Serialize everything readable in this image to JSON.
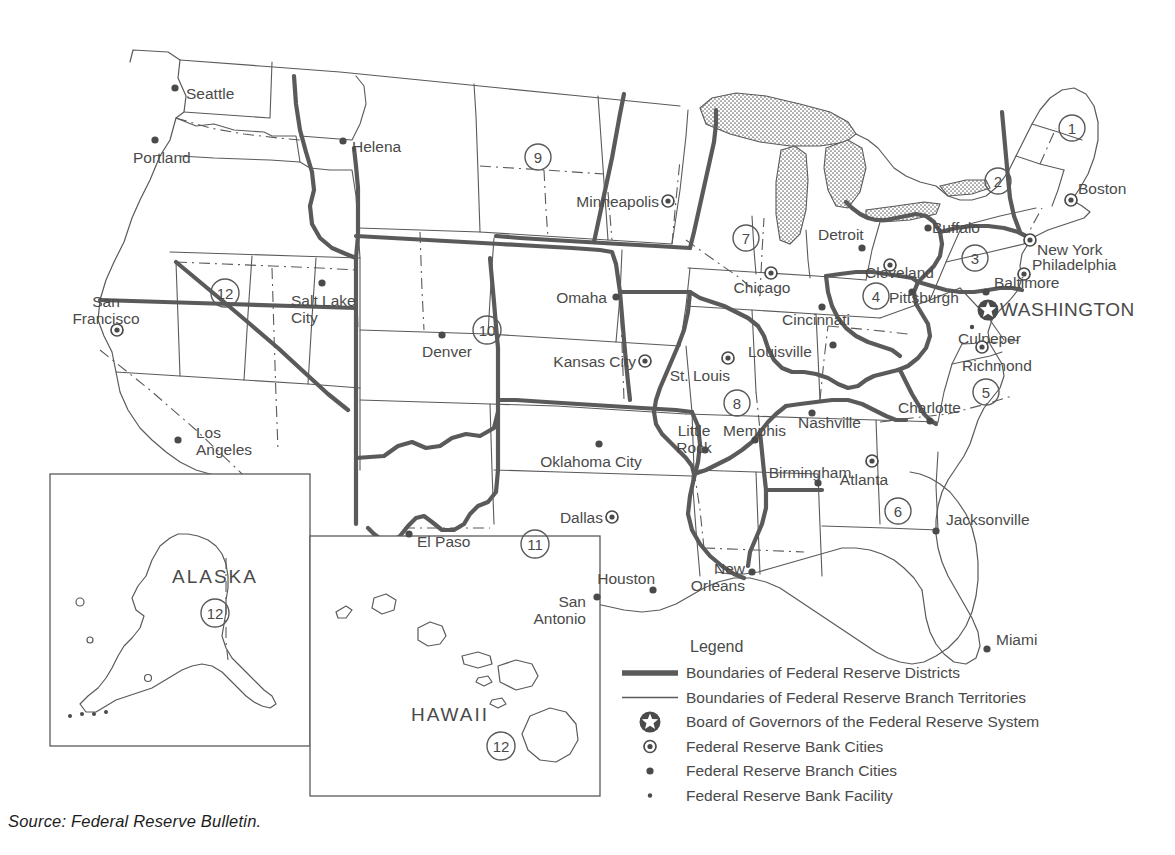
{
  "source_caption": "Source: Federal Reserve Bulletin.",
  "colors": {
    "line": "#5a5a5a",
    "text": "#4a4a4a",
    "background": "#ffffff",
    "marker": "#4a4a4a"
  },
  "legend": {
    "title": "Legend",
    "items": [
      {
        "symbol": "thick-line",
        "label": "Boundaries of Federal Reserve Districts"
      },
      {
        "symbol": "thin-line",
        "label": "Boundaries of Federal Reserve Branch Territories"
      },
      {
        "symbol": "star-in-circle",
        "label": "Board of Governors of the Federal Reserve System"
      },
      {
        "symbol": "dot-in-circle",
        "label": "Federal Reserve Bank Cities"
      },
      {
        "symbol": "filled-dot",
        "label": "Federal Reserve Branch Cities"
      },
      {
        "symbol": "small-dot",
        "label": "Federal Reserve Bank Facility"
      }
    ]
  },
  "insets": [
    {
      "name": "ALASKA",
      "district": "12",
      "label_x": 215,
      "label_y": 583,
      "num_x": 215,
      "num_y": 613
    },
    {
      "name": "HAWAII",
      "district": "12",
      "label_x": 450,
      "label_y": 721,
      "num_x": 501,
      "num_y": 746
    }
  ],
  "districts": [
    {
      "number": "1",
      "x": 1072,
      "y": 128
    },
    {
      "number": "2",
      "x": 998,
      "y": 181
    },
    {
      "number": "3",
      "x": 975,
      "y": 258
    },
    {
      "number": "4",
      "x": 876,
      "y": 296
    },
    {
      "number": "5",
      "x": 986,
      "y": 392
    },
    {
      "number": "6",
      "x": 898,
      "y": 511
    },
    {
      "number": "7",
      "x": 746,
      "y": 238
    },
    {
      "number": "8",
      "x": 737,
      "y": 403
    },
    {
      "number": "9",
      "x": 538,
      "y": 157
    },
    {
      "number": "10",
      "x": 487,
      "y": 330
    },
    {
      "number": "11",
      "x": 535,
      "y": 544
    },
    {
      "number": "12",
      "x": 225,
      "y": 293
    }
  ],
  "cities": [
    {
      "name": "Seattle",
      "type": "branch",
      "mx": 175,
      "my": 88,
      "tx": 186,
      "ty": 99,
      "anchor": "start"
    },
    {
      "name": "Portland",
      "type": "branch",
      "mx": 155,
      "my": 140,
      "tx": 133,
      "ty": 163,
      "anchor": "start"
    },
    {
      "name": "Helena",
      "type": "branch",
      "mx": 343,
      "my": 141,
      "tx": 352,
      "ty": 152,
      "anchor": "start"
    },
    {
      "name": "San\nFrancisco",
      "type": "bank",
      "mx": 117,
      "my": 330,
      "tx": 106,
      "ty": 307,
      "anchor": "middle"
    },
    {
      "name": "Los\nAngeles",
      "type": "branch",
      "mx": 178,
      "my": 440,
      "tx": 196,
      "ty": 438,
      "anchor": "start"
    },
    {
      "name": "Salt Lake\nCity",
      "type": "branch",
      "mx": 322,
      "my": 283,
      "tx": 291,
      "ty": 306,
      "anchor": "start"
    },
    {
      "name": "Denver",
      "type": "branch",
      "mx": 442,
      "my": 335,
      "tx": 422,
      "ty": 357,
      "anchor": "start"
    },
    {
      "name": "Minneapolis",
      "type": "bank",
      "mx": 668,
      "my": 201,
      "tx": 659,
      "ty": 207,
      "anchor": "end"
    },
    {
      "name": "Omaha",
      "type": "branch",
      "mx": 616,
      "my": 297,
      "tx": 607,
      "ty": 303,
      "anchor": "end"
    },
    {
      "name": "Kansas City",
      "type": "bank",
      "mx": 645,
      "my": 361,
      "tx": 636,
      "ty": 367,
      "anchor": "end"
    },
    {
      "name": "Oklahoma City",
      "type": "branch",
      "mx": 599,
      "my": 444,
      "tx": 591,
      "ty": 467,
      "anchor": "middle"
    },
    {
      "name": "Dallas",
      "type": "bank",
      "mx": 612,
      "my": 517,
      "tx": 603,
      "ty": 523,
      "anchor": "end"
    },
    {
      "name": "El Paso",
      "type": "branch",
      "mx": 409,
      "my": 534,
      "tx": 417,
      "ty": 547,
      "anchor": "start"
    },
    {
      "name": "San\nAntonio",
      "type": "branch",
      "mx": 597,
      "my": 597,
      "tx": 586,
      "ty": 607,
      "anchor": "end"
    },
    {
      "name": "Houston",
      "type": "branch",
      "mx": 653,
      "my": 590,
      "tx": 655,
      "ty": 584,
      "anchor": "end"
    },
    {
      "name": "Little\nRock",
      "type": "branch",
      "mx": 705,
      "my": 450,
      "tx": 694,
      "ty": 436,
      "anchor": "middle"
    },
    {
      "name": "St. Louis",
      "type": "bank",
      "mx": 728,
      "my": 358,
      "tx": 730,
      "ty": 381,
      "anchor": "end"
    },
    {
      "name": "Chicago",
      "type": "bank",
      "mx": 771,
      "my": 273,
      "tx": 762,
      "ty": 293,
      "anchor": "middle"
    },
    {
      "name": "Detroit",
      "type": "branch",
      "mx": 862,
      "my": 248,
      "tx": 818,
      "ty": 240,
      "anchor": "start"
    },
    {
      "name": "Louisville",
      "type": "branch",
      "mx": 833,
      "my": 345,
      "tx": 748,
      "ty": 357,
      "anchor": "start"
    },
    {
      "name": "Cincinnati",
      "type": "branch",
      "mx": 822,
      "my": 307,
      "tx": 782,
      "ty": 325,
      "anchor": "start"
    },
    {
      "name": "Cleveland",
      "type": "bank",
      "mx": 890,
      "my": 265,
      "tx": 865,
      "ty": 278,
      "anchor": "start"
    },
    {
      "name": "Pittsburgh",
      "type": "branch",
      "mx": 912,
      "my": 292,
      "tx": 889,
      "ty": 303,
      "anchor": "start"
    },
    {
      "name": "Buffalo",
      "type": "branch",
      "mx": 928,
      "my": 228,
      "tx": 932,
      "ty": 233,
      "anchor": "start"
    },
    {
      "name": "Boston",
      "type": "bank",
      "mx": 1071,
      "my": 200,
      "tx": 1078,
      "ty": 194,
      "anchor": "start"
    },
    {
      "name": "New York",
      "type": "bank",
      "mx": 1030,
      "my": 240,
      "tx": 1037,
      "ty": 255,
      "anchor": "start"
    },
    {
      "name": "Philadelphia",
      "type": "bank",
      "mx": 1024,
      "my": 274,
      "tx": 1032,
      "ty": 270,
      "anchor": "start"
    },
    {
      "name": "Baltimore",
      "type": "branch",
      "mx": 986,
      "my": 292,
      "tx": 994,
      "ty": 288,
      "anchor": "start"
    },
    {
      "name": "WASHINGTON",
      "type": "star",
      "mx": 988,
      "my": 310,
      "tx": 1000,
      "ty": 316,
      "anchor": "start"
    },
    {
      "name": "Culpeper",
      "type": "facility",
      "mx": 972,
      "my": 327,
      "tx": 958,
      "ty": 344,
      "anchor": "start"
    },
    {
      "name": "Richmond",
      "type": "bank",
      "mx": 982,
      "my": 347,
      "tx": 962,
      "ty": 371,
      "anchor": "start"
    },
    {
      "name": "Charlotte",
      "type": "branch",
      "mx": 930,
      "my": 421,
      "tx": 898,
      "ty": 413,
      "anchor": "start"
    },
    {
      "name": "Nashville",
      "type": "branch",
      "mx": 812,
      "my": 413,
      "tx": 798,
      "ty": 428,
      "anchor": "start"
    },
    {
      "name": "Memphis",
      "type": "branch",
      "mx": 755,
      "my": 440,
      "tx": 786,
      "ty": 436,
      "anchor": "end"
    },
    {
      "name": "Birmingham",
      "type": "branch",
      "mx": 818,
      "my": 483,
      "tx": 810,
      "ty": 478,
      "anchor": "middle"
    },
    {
      "name": "Atlanta",
      "type": "bank",
      "mx": 872,
      "my": 461,
      "tx": 864,
      "ty": 485,
      "anchor": "middle"
    },
    {
      "name": "Jacksonville",
      "type": "branch",
      "mx": 936,
      "my": 531,
      "tx": 946,
      "ty": 525,
      "anchor": "start"
    },
    {
      "name": "Miami",
      "type": "branch",
      "mx": 987,
      "my": 649,
      "tx": 996,
      "ty": 645,
      "anchor": "start"
    },
    {
      "name": "New\nOrleans",
      "type": "branch",
      "mx": 752,
      "my": 572,
      "tx": 745,
      "ty": 574,
      "anchor": "end"
    }
  ]
}
